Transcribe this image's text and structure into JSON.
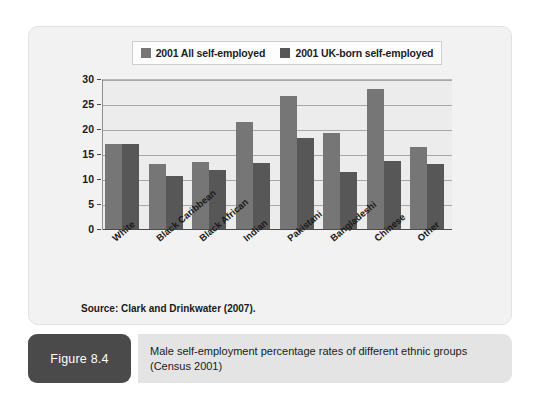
{
  "figure": {
    "number_label": "Figure 8.4",
    "caption": "Male self-employment percentage rates of different ethnic groups\n(Census 2001)",
    "source": "Source: Clark and Drinkwater (2007)."
  },
  "colors": {
    "series_all": "#767676",
    "series_uk": "#575757",
    "plot_background": "#ececec",
    "panel_background": "#f2f2f2",
    "badge_background": "#4a4a4a",
    "caption_background": "#e4e4e4",
    "gridline": "#a8a8a8",
    "axis": "#4a4a4a"
  },
  "chart_data": {
    "type": "bar",
    "title": "",
    "xlabel": "",
    "ylabel": "",
    "ylim": [
      0,
      30
    ],
    "yticks": [
      0,
      5,
      10,
      15,
      20,
      25,
      30
    ],
    "grid": true,
    "legend_position": "top",
    "categories": [
      "White",
      "Black Caribbean",
      "Black African",
      "Indian",
      "Pakistani",
      "Bangladeshi",
      "Chinese",
      "Other"
    ],
    "series": [
      {
        "name": "2001 All self-employed",
        "color": "#767676",
        "values": [
          17.1,
          13.0,
          13.5,
          21.5,
          26.7,
          19.3,
          28.1,
          16.5
        ]
      },
      {
        "name": "2001 UK-born self-employed",
        "color": "#575757",
        "values": [
          17.0,
          10.7,
          11.8,
          13.2,
          18.3,
          11.4,
          13.6,
          13.1
        ]
      }
    ]
  }
}
